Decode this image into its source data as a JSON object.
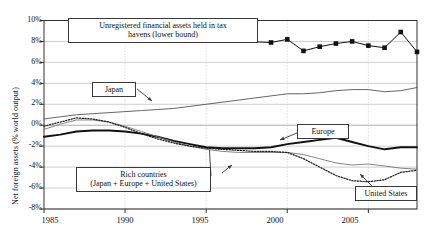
{
  "chart_data": {
    "type": "line",
    "title": "",
    "xlabel": "",
    "ylabel": "Net foreign assets (% world output)",
    "xlim": [
      1985,
      2008
    ],
    "ylim": [
      -8,
      10
    ],
    "grid": true,
    "legend_position": "inline-callouts",
    "xticks": [
      "1985",
      "1990",
      "1995",
      "2000",
      "2005"
    ],
    "xtick_values": [
      1985,
      1990,
      1995,
      2000,
      2005
    ],
    "yticks": [
      "10%",
      "8%",
      "6%",
      "4%",
      "2%",
      "0%",
      "-2%",
      "-4%",
      "-6%",
      "-8%"
    ],
    "ytick_values": [
      10,
      8,
      6,
      4,
      2,
      0,
      -2,
      -4,
      -6,
      -8
    ],
    "x": [
      1985,
      1986,
      1987,
      1988,
      1989,
      1990,
      1991,
      1992,
      1993,
      1994,
      1995,
      1996,
      1997,
      1998,
      1999,
      2000,
      2001,
      2002,
      2003,
      2004,
      2005,
      2006,
      2007,
      2008
    ],
    "series": [
      {
        "name": "Unregistered financial assets held in tax havens (lower bound)",
        "style": "line-with-square-markers",
        "color": "#111111",
        "x": [
          1999,
          2000,
          2001,
          2002,
          2003,
          2004,
          2005,
          2006,
          2007,
          2008
        ],
        "values": [
          7.9,
          8.2,
          7.1,
          7.5,
          7.8,
          8.0,
          7.6,
          7.4,
          8.9,
          7.0
        ],
        "segment_start_x": 1987,
        "segment_start_value": 8.6
      },
      {
        "name": "Japan",
        "style": "thin-line",
        "color": "#555555",
        "values": [
          0.6,
          0.8,
          1.0,
          1.1,
          1.2,
          1.3,
          1.4,
          1.5,
          1.6,
          1.8,
          2.0,
          2.2,
          2.4,
          2.6,
          2.8,
          3.0,
          3.0,
          3.1,
          3.3,
          3.4,
          3.4,
          3.2,
          3.3,
          3.6
        ]
      },
      {
        "name": "Europe",
        "style": "thick-line",
        "color": "#111111",
        "values": [
          -1.1,
          -0.9,
          -0.6,
          -0.5,
          -0.5,
          -0.6,
          -0.8,
          -1.1,
          -1.5,
          -1.8,
          -2.1,
          -2.2,
          -2.2,
          -2.2,
          -2.1,
          -1.8,
          -1.6,
          -1.4,
          -1.2,
          -1.6,
          -2.0,
          -2.3,
          -2.1,
          -2.1
        ]
      },
      {
        "name": "Rich countries (Japan + Europe + United States)",
        "style": "thin-line",
        "color": "#777777",
        "values": [
          -0.4,
          0.1,
          0.5,
          0.5,
          0.3,
          -0.1,
          -0.6,
          -1.1,
          -1.6,
          -2.0,
          -2.3,
          -2.5,
          -2.6,
          -2.6,
          -2.6,
          -2.6,
          -2.8,
          -3.2,
          -3.6,
          -3.8,
          -3.7,
          -3.9,
          -4.1,
          -4.2
        ]
      },
      {
        "name": "United States",
        "style": "dotted-line",
        "color": "#222222",
        "values": [
          -0.1,
          0.3,
          0.7,
          0.6,
          0.3,
          -0.2,
          -0.8,
          -1.3,
          -1.7,
          -2.0,
          -2.2,
          -2.3,
          -2.4,
          -2.5,
          -2.5,
          -2.6,
          -3.2,
          -4.0,
          -4.8,
          -5.3,
          -5.4,
          -5.2,
          -4.5,
          -4.3
        ]
      }
    ],
    "annotations": [
      {
        "id": "taxhaven-callout",
        "line1": "Unregistered financial assets held in tax",
        "line2": "havens (lower bound)"
      },
      {
        "id": "japan-callout",
        "line1": "Japan",
        "line2": ""
      },
      {
        "id": "europe-callout",
        "line1": "Europe",
        "line2": ""
      },
      {
        "id": "rich-countries-callout",
        "line1": "Rich countries",
        "line2": "(Japan + Europe + United States)"
      },
      {
        "id": "united-states-callout",
        "line1": "United States",
        "line2": ""
      }
    ]
  },
  "axis": {
    "y_title": "Net foreign assets (% world output)",
    "y_labels": [
      "10%",
      "8%",
      "6%",
      "4%",
      "2%",
      "0%",
      "-2%",
      "-4%",
      "-6%",
      "-8%"
    ],
    "x_labels": [
      "1985",
      "1990",
      "1995",
      "2000",
      "2005"
    ]
  },
  "callouts": {
    "taxhavens_line1": "Unregistered financial assets held in tax",
    "taxhavens_line2": "havens (lower bound)",
    "japan": "Japan",
    "europe": "Europe",
    "rich_line1": "Rich countries",
    "rich_line2": "(Japan + Europe + United States)",
    "united_states": "United States"
  }
}
